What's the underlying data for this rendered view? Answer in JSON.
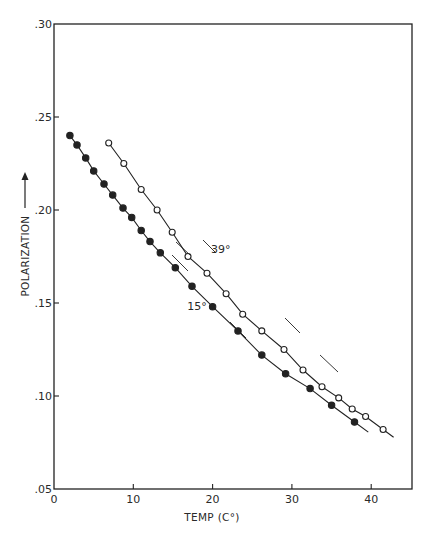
{
  "chart_data": {
    "type": "line",
    "title": "",
    "xlabel": "TEMP (C°)",
    "ylabel": "POLARIZATION",
    "ylabel_arrow": "→",
    "xlim": [
      0,
      45
    ],
    "ylim": [
      0.05,
      0.3
    ],
    "x_ticks": [
      0,
      10,
      20,
      30,
      40
    ],
    "x_tick_labels": [
      "0",
      "10",
      "20",
      "30",
      "40"
    ],
    "y_ticks": [
      0.05,
      0.1,
      0.15,
      0.2,
      0.25,
      0.3
    ],
    "y_tick_labels": [
      ".05",
      ".10",
      ".15",
      ".20",
      ".25",
      ".30"
    ],
    "grid": false,
    "legend": "none (curves labeled inline)",
    "series": [
      {
        "name": "15°",
        "marker": "filled-circle",
        "x": [
          2.0,
          2.9,
          4.0,
          5.0,
          6.3,
          7.4,
          8.7,
          9.8,
          11.0,
          12.1,
          13.4,
          15.3,
          17.4,
          20.0,
          23.2,
          26.2,
          29.2,
          32.3,
          35.0,
          37.9
        ],
        "y": [
          0.24,
          0.235,
          0.228,
          0.221,
          0.214,
          0.208,
          0.201,
          0.196,
          0.189,
          0.183,
          0.177,
          0.169,
          0.159,
          0.148,
          0.135,
          0.122,
          0.112,
          0.104,
          0.095,
          0.086
        ]
      },
      {
        "name": "39°",
        "marker": "open-circle",
        "x": [
          6.9,
          8.8,
          11.0,
          13.0,
          14.9,
          16.9,
          19.3,
          21.7,
          23.8,
          26.2,
          29.0,
          31.4,
          33.8,
          35.9,
          37.6,
          39.3,
          41.5
        ],
        "y": [
          0.236,
          0.225,
          0.211,
          0.2,
          0.188,
          0.175,
          0.166,
          0.155,
          0.144,
          0.135,
          0.125,
          0.114,
          0.105,
          0.099,
          0.093,
          0.089,
          0.082
        ]
      }
    ],
    "annotations": [
      {
        "text": "39°",
        "x": 19.8,
        "y": 0.177
      },
      {
        "text": "15°",
        "x": 16.8,
        "y": 0.146
      }
    ]
  },
  "colors": {
    "ink": "#222222",
    "background": "#ffffff"
  }
}
